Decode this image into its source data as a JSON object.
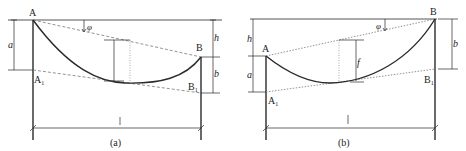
{
  "figures": [
    {
      "id": "a",
      "caption": "(a)",
      "points": {
        "A": "A",
        "B": "B",
        "A1": "A",
        "A1_sub": "1",
        "B1": "B",
        "B1_sub": "1"
      },
      "dimensions": {
        "a": "a",
        "b": "b",
        "h": "h",
        "f": "f",
        "l": "l",
        "phi": "φ"
      }
    },
    {
      "id": "b",
      "caption": "(b)",
      "points": {
        "A": "A",
        "B": "B",
        "A1": "A",
        "A1_sub": "1",
        "B1": "B",
        "B1_sub": "1"
      },
      "dimensions": {
        "a": "a",
        "b": "b",
        "h": "h",
        "f": "f",
        "l": "l",
        "phi": "φ"
      }
    }
  ],
  "colors": {
    "line": "#2a2a2a",
    "dashed": "#777777",
    "background": "#ffffff"
  }
}
